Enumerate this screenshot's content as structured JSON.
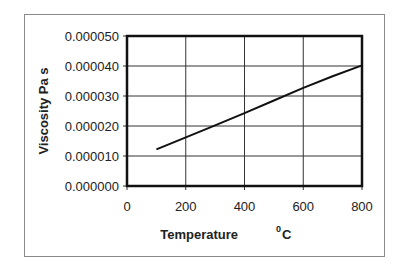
{
  "chart_data": {
    "type": "line",
    "title": "",
    "xlabel": "Temperature",
    "xlabel_unit_sup": "0",
    "xlabel_unit": "C",
    "ylabel": "Viscosity Pa s",
    "xlim": [
      0,
      800
    ],
    "ylim": [
      0.0,
      5e-05
    ],
    "x_ticks": [
      "0",
      "200",
      "400",
      "600",
      "800"
    ],
    "y_ticks": [
      "0.000000",
      "0.000010",
      "0.000020",
      "0.000030",
      "0.000040",
      "0.000050"
    ],
    "grid": true,
    "legend": null,
    "series": [
      {
        "name": "Viscosity",
        "x": [
          100,
          200,
          300,
          400,
          500,
          600,
          700,
          800
        ],
        "values": [
          1.22e-05,
          1.62e-05,
          2.02e-05,
          2.43e-05,
          2.85e-05,
          3.27e-05,
          3.66e-05,
          4.02e-05
        ]
      }
    ]
  }
}
